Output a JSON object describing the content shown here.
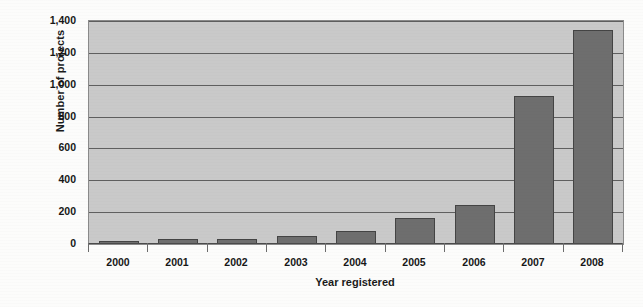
{
  "chart_data": {
    "type": "bar",
    "title": "",
    "xlabel": "Year registered",
    "ylabel": "Number of projects",
    "categories": [
      "2000",
      "2001",
      "2002",
      "2003",
      "2004",
      "2005",
      "2006",
      "2007",
      "2008"
    ],
    "values": [
      10,
      30,
      33,
      52,
      80,
      165,
      245,
      930,
      1345
    ],
    "series": [
      {
        "name": "Number of projects",
        "values": [
          10,
          30,
          33,
          52,
          80,
          165,
          245,
          930,
          1345
        ]
      }
    ],
    "ylim": [
      0,
      1400
    ],
    "ytick_values": [
      0,
      200,
      400,
      600,
      800,
      1000,
      1200,
      1400
    ],
    "ytick_labels": [
      "0",
      "200",
      "400",
      "600",
      "800",
      "1,000",
      "1,200",
      "1,400"
    ],
    "grid": true,
    "grid_axis": "y",
    "legend": false,
    "legend_position": "none",
    "bar_color": "#6e6e6e",
    "bar_border_color": "#444444",
    "plot_background_color": "#c9c9c9",
    "gridline_color": "#5f5f5f",
    "page_background_color": "#fcfcfb"
  }
}
